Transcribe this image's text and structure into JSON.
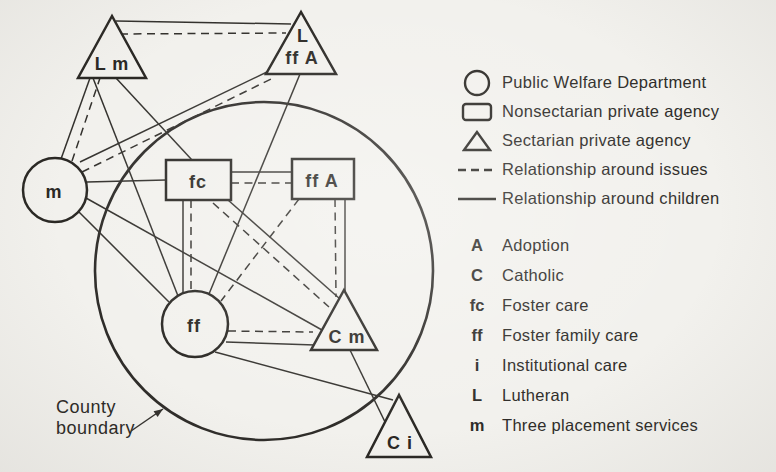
{
  "diagram": {
    "boundary": {
      "cx": 264,
      "cy": 271,
      "r": 169,
      "label_line1": "County",
      "label_line2": "boundary",
      "label_x": 56,
      "label_y": 413,
      "arrow": {
        "x1": 131,
        "y1": 431,
        "x2": 163,
        "y2": 409
      }
    },
    "nodes": [
      {
        "id": "sectarian-Lm",
        "shape": "triangle",
        "cx": 112,
        "apex_y": 16,
        "base_y": 78,
        "halfw": 34,
        "labels": [
          {
            "t": "L m",
            "x": 112,
            "y": 70
          }
        ]
      },
      {
        "id": "sectarian-LffA",
        "shape": "triangle",
        "cx": 301,
        "apex_y": 12,
        "base_y": 74,
        "halfw": 35,
        "labels": [
          {
            "t": "L",
            "x": 303,
            "y": 42
          },
          {
            "t": "ff A",
            "x": 302,
            "y": 64
          }
        ]
      },
      {
        "id": "public-m",
        "shape": "circle",
        "cx": 55,
        "cy": 190,
        "r": 32,
        "labels": [
          {
            "t": "m",
            "x": 54,
            "y": 198
          }
        ]
      },
      {
        "id": "nonsect-fc",
        "shape": "rect",
        "x": 166,
        "y": 160,
        "w": 65,
        "h": 40,
        "labels": [
          {
            "t": "fc",
            "x": 198,
            "y": 188
          }
        ]
      },
      {
        "id": "nonsect-ffA",
        "shape": "rect",
        "x": 292,
        "y": 159,
        "w": 62,
        "h": 40,
        "labels": [
          {
            "t": "ff A",
            "x": 322,
            "y": 187
          }
        ]
      },
      {
        "id": "public-ff",
        "shape": "circle",
        "cx": 195,
        "cy": 324,
        "r": 33,
        "labels": [
          {
            "t": "ff",
            "x": 194,
            "y": 332
          }
        ]
      },
      {
        "id": "sectarian-Cm",
        "shape": "triangle",
        "cx": 344,
        "apex_y": 290,
        "base_y": 350,
        "halfw": 33,
        "labels": [
          {
            "t": "C m",
            "x": 347,
            "y": 343
          }
        ]
      },
      {
        "id": "sectarian-Ci",
        "shape": "triangle",
        "cx": 399,
        "apex_y": 395,
        "base_y": 457,
        "halfw": 32,
        "labels": [
          {
            "t": "C i",
            "x": 400,
            "y": 449
          }
        ]
      }
    ],
    "edges": [
      {
        "from": "Lm",
        "to": "LffA",
        "style": "solid",
        "x1": 116,
        "y1": 21,
        "x2": 291,
        "y2": 24
      },
      {
        "from": "Lm",
        "to": "LffA",
        "style": "dashed",
        "x1": 120,
        "y1": 34,
        "x2": 286,
        "y2": 33
      },
      {
        "from": "m",
        "to": "Lm",
        "style": "solid",
        "x1": 61,
        "y1": 159,
        "x2": 90,
        "y2": 78
      },
      {
        "from": "m",
        "to": "Lm",
        "style": "dashed",
        "x1": 72,
        "y1": 161,
        "x2": 100,
        "y2": 78
      },
      {
        "from": "m",
        "to": "LffA",
        "style": "solid",
        "x1": 80,
        "y1": 162,
        "x2": 269,
        "y2": 71
      },
      {
        "from": "m",
        "to": "LffA",
        "style": "dashed",
        "x1": 82,
        "y1": 172,
        "x2": 271,
        "y2": 79
      },
      {
        "from": "m",
        "to": "fc",
        "style": "solid",
        "x1": 87,
        "y1": 182,
        "x2": 166,
        "y2": 180
      },
      {
        "from": "m",
        "to": "ff",
        "style": "solid",
        "x1": 79,
        "y1": 212,
        "x2": 169,
        "y2": 302
      },
      {
        "from": "m",
        "to": "Cm",
        "style": "solid",
        "x1": 86,
        "y1": 198,
        "x2": 322,
        "y2": 330
      },
      {
        "from": "Lm",
        "to": "fc",
        "style": "solid",
        "x1": 116,
        "y1": 78,
        "x2": 192,
        "y2": 160
      },
      {
        "from": "Lm",
        "to": "ff",
        "style": "solid",
        "x1": 93,
        "y1": 78,
        "x2": 178,
        "y2": 296
      },
      {
        "from": "LffA",
        "to": "ff",
        "style": "solid",
        "x1": 300,
        "y1": 74,
        "x2": 209,
        "y2": 294
      },
      {
        "from": "fc",
        "to": "ffA",
        "style": "solid",
        "x1": 231,
        "y1": 172,
        "x2": 292,
        "y2": 172
      },
      {
        "from": "fc",
        "to": "ffA",
        "style": "dashed",
        "x1": 231,
        "y1": 183,
        "x2": 292,
        "y2": 183
      },
      {
        "from": "fc",
        "to": "ff",
        "style": "solid",
        "x1": 183,
        "y1": 200,
        "x2": 183,
        "y2": 293
      },
      {
        "from": "fc",
        "to": "ff",
        "style": "dashed",
        "x1": 191,
        "y1": 200,
        "x2": 191,
        "y2": 291
      },
      {
        "from": "ffA",
        "to": "Cm",
        "style": "solid",
        "x1": 345,
        "y1": 199,
        "x2": 345,
        "y2": 292
      },
      {
        "from": "ffA",
        "to": "Cm",
        "style": "dashed",
        "x1": 335,
        "y1": 199,
        "x2": 336,
        "y2": 297
      },
      {
        "from": "ff",
        "to": "Cm",
        "style": "solid",
        "x1": 226,
        "y1": 342,
        "x2": 315,
        "y2": 345
      },
      {
        "from": "ff",
        "to": "Cm",
        "style": "dashed",
        "x1": 228,
        "y1": 331,
        "x2": 313,
        "y2": 332
      },
      {
        "from": "fc",
        "to": "Cm",
        "style": "solid",
        "x1": 228,
        "y1": 200,
        "x2": 340,
        "y2": 299
      },
      {
        "from": "fc",
        "to": "Cm",
        "style": "dashed",
        "x1": 213,
        "y1": 203,
        "x2": 329,
        "y2": 307
      },
      {
        "from": "ffA",
        "to": "ff",
        "style": "dashed",
        "x1": 299,
        "y1": 199,
        "x2": 221,
        "y2": 301
      },
      {
        "from": "Cm",
        "to": "Ci",
        "style": "solid",
        "x1": 350,
        "y1": 350,
        "x2": 386,
        "y2": 424
      },
      {
        "from": "ff",
        "to": "Ci",
        "style": "solid",
        "x1": 215,
        "y1": 352,
        "x2": 393,
        "y2": 400
      }
    ]
  },
  "legend": {
    "shapes": [
      {
        "icon": "circle-icon",
        "label": "Public Welfare Department"
      },
      {
        "icon": "rect-icon",
        "label": "Nonsectarian private agency"
      },
      {
        "icon": "triangle-icon",
        "label": "Sectarian private agency"
      },
      {
        "icon": "dashed-line-icon",
        "label": "Relationship around issues"
      },
      {
        "icon": "solid-line-icon",
        "label": "Relationship around children"
      }
    ],
    "keys": [
      {
        "key": "A",
        "label": "Adoption"
      },
      {
        "key": "C",
        "label": "Catholic"
      },
      {
        "key": "fc",
        "label": "Foster care"
      },
      {
        "key": "ff",
        "label": "Foster family care"
      },
      {
        "key": "i",
        "label": "Institutional care"
      },
      {
        "key": "L",
        "label": "Lutheran"
      },
      {
        "key": "m",
        "label": "Three placement services"
      }
    ]
  }
}
